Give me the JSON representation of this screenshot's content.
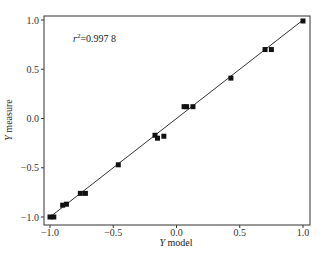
{
  "chart_data": {
    "type": "scatter",
    "title": "",
    "xlabel": "Y model",
    "ylabel": "Y measure",
    "xlim": [
      -1.05,
      1.05
    ],
    "ylim": [
      -1.05,
      1.05
    ],
    "xticks": [
      "-1.0",
      "-0.5",
      "0.0",
      "0.5",
      "1.0"
    ],
    "yticks": [
      "1.0",
      "0.5",
      "0.0",
      "-0.5",
      "-1.0"
    ],
    "grid": false,
    "legend": null,
    "annotation": "r²=0.997 8",
    "fit_line": {
      "x": [
        -1.0,
        1.0
      ],
      "y": [
        -1.0,
        1.0
      ]
    },
    "points": [
      {
        "x": -1.0,
        "y": -1.0
      },
      {
        "x": -0.97,
        "y": -1.0
      },
      {
        "x": -0.9,
        "y": -0.88
      },
      {
        "x": -0.87,
        "y": -0.87
      },
      {
        "x": -0.76,
        "y": -0.76
      },
      {
        "x": -0.72,
        "y": -0.76
      },
      {
        "x": -0.46,
        "y": -0.47
      },
      {
        "x": -0.17,
        "y": -0.17
      },
      {
        "x": -0.15,
        "y": -0.2
      },
      {
        "x": -0.1,
        "y": -0.18
      },
      {
        "x": 0.06,
        "y": 0.12
      },
      {
        "x": 0.08,
        "y": 0.12
      },
      {
        "x": 0.13,
        "y": 0.12
      },
      {
        "x": 0.43,
        "y": 0.41
      },
      {
        "x": 0.7,
        "y": 0.7
      },
      {
        "x": 0.75,
        "y": 0.7
      },
      {
        "x": 1.0,
        "y": 0.99
      }
    ]
  },
  "labels": {
    "annotation_r": "r",
    "annotation_sup": "2",
    "annotation_val": "=0.997 8",
    "xlabel_var": "Y",
    "xlabel_text": " model",
    "ylabel_var": "Y",
    "ylabel_text": " measure"
  }
}
